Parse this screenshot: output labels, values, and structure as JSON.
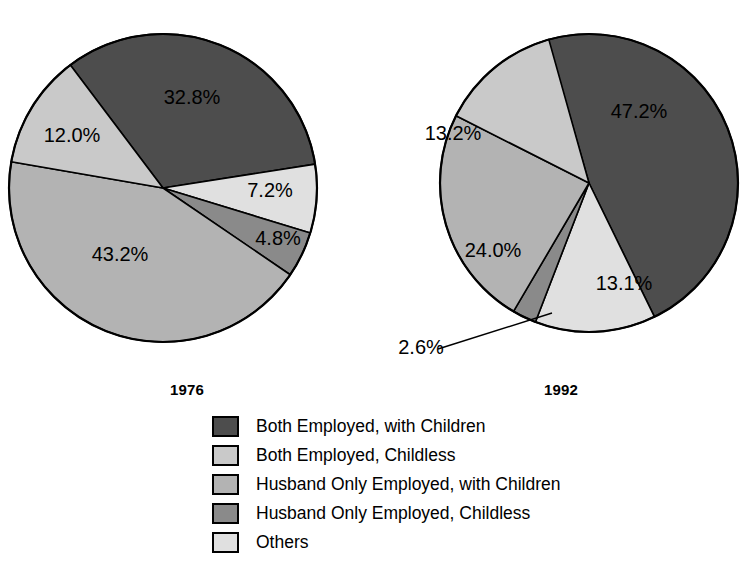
{
  "chart_data": {
    "type": "pie",
    "title": "",
    "subtitle": "",
    "legend_position": "bottom",
    "categories": [
      "Both Employed, with Children",
      "Both Employed, Childless",
      "Husband Only Employed, with Children",
      "Husband Only Employed, Childless",
      "Others"
    ],
    "colors": [
      "#4d4d4d",
      "#c9c9c9",
      "#b3b3b3",
      "#8a8a8a",
      "#e0e0e0"
    ],
    "charts": [
      {
        "name": "1976",
        "label": "1976",
        "values": [
          32.8,
          12.0,
          43.2,
          4.8,
          7.2
        ],
        "value_labels": [
          "32.8%",
          "12.0%",
          "43.2%",
          "4.8%",
          "7.2%"
        ]
      },
      {
        "name": "1992",
        "label": "1992",
        "values": [
          47.2,
          13.2,
          24.0,
          2.6,
          13.1
        ],
        "value_labels": [
          "47.2%",
          "13.2%",
          "24.0%",
          "2.6%",
          "13.1%"
        ]
      }
    ]
  },
  "pies": {
    "p1976": {
      "year": "1976",
      "slice_0": "32.8%",
      "slice_1": "12.0%",
      "slice_2": "43.2%",
      "slice_3": "4.8%",
      "slice_4": "7.2%"
    },
    "p1992": {
      "year": "1992",
      "slice_0": "47.2%",
      "slice_1": "13.2%",
      "slice_2": "24.0%",
      "slice_3": "2.6%",
      "slice_4": "13.1%"
    }
  },
  "legend": {
    "items": [
      {
        "label": "Both Employed, with Children",
        "color": "#4d4d4d"
      },
      {
        "label": "Both Employed, Childless",
        "color": "#c9c9c9"
      },
      {
        "label": "Husband Only Employed, with Children",
        "color": "#b3b3b3"
      },
      {
        "label": "Husband Only Employed, Childless",
        "color": "#8a8a8a"
      },
      {
        "label": "Others",
        "color": "#e0e0e0"
      }
    ]
  }
}
